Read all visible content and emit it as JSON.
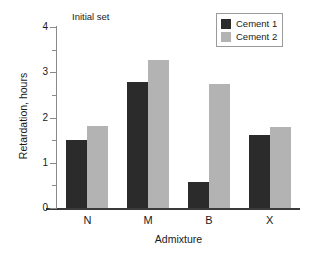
{
  "chart_data": {
    "type": "bar",
    "title": "Initial set",
    "xlabel": "Admixture",
    "ylabel": "Retardation, hours",
    "categories": [
      "N",
      "M",
      "B",
      "X"
    ],
    "series": [
      {
        "name": "Cement 1",
        "color": "#2b2b2b",
        "values": [
          1.5,
          2.78,
          0.57,
          1.62
        ]
      },
      {
        "name": "Cement 2",
        "color": "#b3b3b3",
        "values": [
          1.82,
          3.27,
          2.75,
          1.78
        ]
      }
    ],
    "ylim": [
      0,
      4
    ],
    "ytick_labels": [
      "0",
      "1",
      "2",
      "3",
      "4"
    ],
    "ytick_values": [
      0,
      1,
      2,
      3,
      4
    ],
    "yminor_values": [
      0.5,
      1.5,
      2.5,
      3.5
    ],
    "grid": false,
    "legend_position": "top-right",
    "axis_color": "#8a8a8a",
    "baseline_color": "#3a3a3a"
  }
}
